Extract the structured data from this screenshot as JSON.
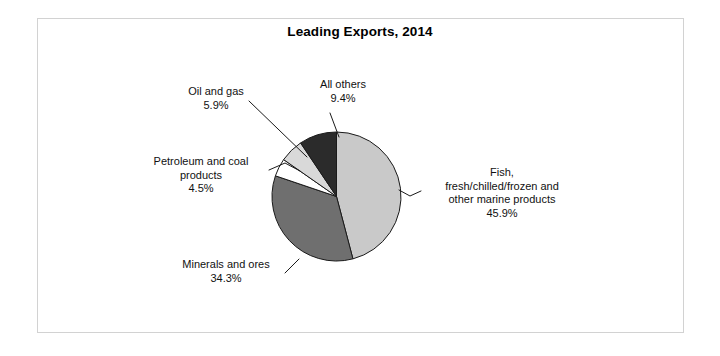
{
  "figure": {
    "title": "Leading Exports, 2014",
    "background_color": "#ffffff",
    "frame_color": "#d2d2d2"
  },
  "chart_data": {
    "type": "pie",
    "title": "Leading Exports, 2014",
    "xlabel": "",
    "ylabel": "",
    "units": "percent",
    "start_angle_deg": 0,
    "direction": "clockwise",
    "legend": "none",
    "grid": false,
    "categories": [
      "Fish, fresh/chilled/frozen and other marine products",
      "Minerals and ores",
      "Petroleum and coal products",
      "Oil and gas",
      "All others"
    ],
    "values": [
      45.9,
      34.3,
      4.5,
      5.9,
      9.4
    ],
    "colors": [
      "#c9c9c9",
      "#6f6f6f",
      "#ffffff",
      "#d9d9d9",
      "#2b2b2b"
    ],
    "slices": [
      {
        "name": "fish",
        "label_lines": [
          "Fish,",
          "fresh/chilled/frozen and",
          "other marine products"
        ],
        "value": 45.9,
        "value_text": "45.9%",
        "color": "#c9c9c9"
      },
      {
        "name": "minerals-and-ores",
        "label_lines": [
          "Minerals and ores"
        ],
        "value": 34.3,
        "value_text": "34.3%",
        "color": "#6f6f6f"
      },
      {
        "name": "petroleum-and-coal-products",
        "label_lines": [
          "Petroleum and coal",
          "products"
        ],
        "value": 4.5,
        "value_text": "4.5%",
        "color": "#ffffff"
      },
      {
        "name": "oil-and-gas",
        "label_lines": [
          "Oil and gas"
        ],
        "value": 5.9,
        "value_text": "5.9%",
        "color": "#d9d9d9"
      },
      {
        "name": "all-others",
        "label_lines": [
          "All others"
        ],
        "value": 9.4,
        "value_text": "9.4%",
        "color": "#2b2b2b"
      }
    ]
  },
  "labels": {
    "oil_and_gas": {
      "line1": "Oil and gas",
      "pct": "5.9%"
    },
    "all_others": {
      "line1": "All others",
      "pct": "9.4%"
    },
    "petroleum": {
      "line1": "Petroleum and coal",
      "line2": "products",
      "pct": "4.5%"
    },
    "fish": {
      "line1": "Fish,",
      "line2": "fresh/chilled/frozen and",
      "line3": "other marine products",
      "pct": "45.9%"
    },
    "minerals": {
      "line1": "Minerals and ores",
      "pct": "34.3%"
    }
  }
}
